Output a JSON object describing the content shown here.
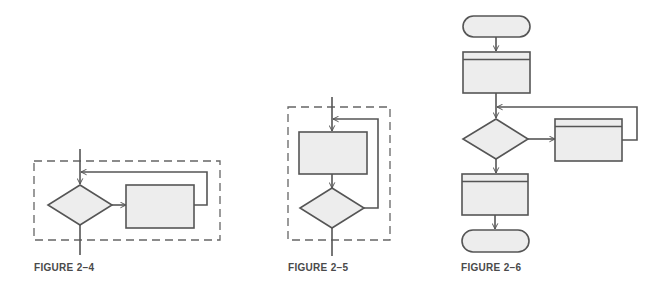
{
  "colors": {
    "stroke": "#555555",
    "fill": "#ededed",
    "dash": "#666666",
    "background": "#ffffff",
    "caption": "#4a4a4a"
  },
  "figures": [
    {
      "id": "2-4",
      "caption": "FIGURE 2–4",
      "structure": "loop with pre-test decision (while): entry -> decision -> process -> back to entry; decision exits down"
    },
    {
      "id": "2-5",
      "caption": "FIGURE 2–5",
      "structure": "loop with post-test decision (do-until): entry -> process -> decision -> back to entry; decision exits down"
    },
    {
      "id": "2-6",
      "caption": "FIGURE 2–6",
      "structure": "terminal -> predefined process -> decision (loop to predefined process on right, back to above decision) -> predefined process -> terminal"
    }
  ],
  "icons": {
    "terminal": "rounded-capsule-shape",
    "process": "rectangle-shape",
    "predefined-process": "rectangle-with-header-line-shape",
    "decision": "diamond-shape",
    "flow-arrow": "open-chevron-arrowhead"
  }
}
